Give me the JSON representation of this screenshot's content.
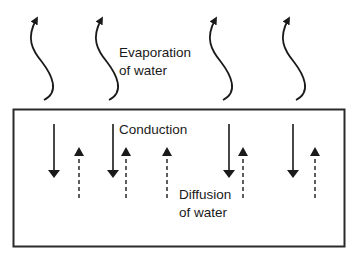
{
  "labels": {
    "evaporation": [
      "Evaporation",
      "of water"
    ],
    "conduction": "Conduction",
    "diffusion": [
      "Diffusion",
      "of water"
    ]
  },
  "colors": {
    "stroke": "#1a1a1a",
    "box": "#2a2a2a",
    "background": "#ffffff"
  },
  "elements": {
    "evaporation_arrows": 4,
    "conduction_arrows": 4,
    "diffusion_arrows": 5
  }
}
